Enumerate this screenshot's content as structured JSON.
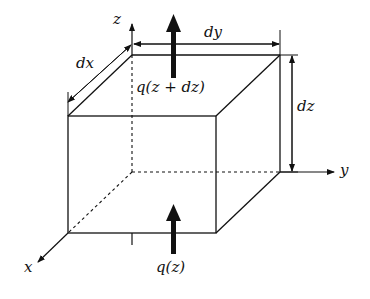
{
  "figure": {
    "labels": {
      "z_axis": "z",
      "y_axis": "y",
      "x_axis": "x",
      "dx": "dx",
      "dy": "dy",
      "dz": "dz",
      "flux_top": "q(z + dz)",
      "flux_bottom": "q(z)"
    },
    "colors": {
      "line": "#111111",
      "background": "#ffffff"
    }
  }
}
